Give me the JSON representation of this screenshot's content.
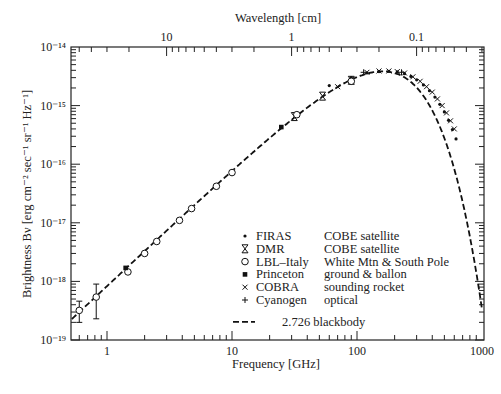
{
  "chart_data": {
    "type": "scatter",
    "title": "",
    "xlabel": "Frequency [GHz]",
    "x2label": "Wavelength [cm]",
    "ylabel": "Brightness Bν [erg cm⁻² sec⁻¹ sr⁻¹ Hz⁻¹]",
    "xscale": "log",
    "yscale": "log",
    "xlim": [
      0.5,
      1000
    ],
    "ylim": [
      1e-19,
      1e-14
    ],
    "x_ticks": [
      1,
      10,
      100,
      1000
    ],
    "x_tick_labels": [
      "1",
      "10",
      "100",
      "1000"
    ],
    "x2_ticks_cm": [
      10,
      1,
      0.1
    ],
    "x2_tick_labels": [
      "10",
      "1",
      "0.1"
    ],
    "y_ticks": [
      1e-14,
      1e-15,
      1e-16,
      1e-17,
      1e-18,
      1e-19
    ],
    "y_tick_labels": [
      "10⁻¹⁴",
      "10⁻¹⁵",
      "10⁻¹⁶",
      "10⁻¹⁷",
      "10⁻¹⁸",
      "10⁻¹⁹"
    ],
    "grid": false,
    "legend_position": "lower center-right inside plot",
    "series": [
      {
        "name": "FIRAS",
        "description": "COBE satellite",
        "marker": "dot",
        "x": [
          60,
          90,
          120,
          150,
          180,
          210,
          240,
          270,
          300,
          340,
          380,
          420,
          460,
          500,
          540,
          580,
          620
        ],
        "y": [
          2.2e-15,
          3e-15,
          3.6e-15,
          3.8e-15,
          3.85e-15,
          3.75e-15,
          3.5e-15,
          3.15e-15,
          2.75e-15,
          2.25e-15,
          1.8e-15,
          1.4e-15,
          1.05e-15,
          7.8e-16,
          5.6e-16,
          3.9e-16,
          2.7e-16
        ]
      },
      {
        "name": "DMR",
        "description": "COBE satellite",
        "marker": "hourglass",
        "x": [
          31.5,
          53,
          90
        ],
        "y": [
          6.5e-16,
          1.45e-15,
          2.7e-15
        ]
      },
      {
        "name": "LBL–Italy",
        "description": "White Mtn & South Pole",
        "marker": "circle",
        "x": [
          0.6,
          0.82,
          1.47,
          2.0,
          2.5,
          3.8,
          4.75,
          7.5,
          10,
          33,
          90
        ],
        "y": [
          3.2e-19,
          5.4e-19,
          1.45e-18,
          3e-18,
          4.8e-18,
          1.1e-17,
          1.75e-17,
          4.2e-17,
          7.2e-17,
          7e-16,
          2.6e-15
        ],
        "errors": [
          [
            2e-19,
            4.6e-19
          ],
          [
            2.3e-19,
            9e-19
          ]
        ]
      },
      {
        "name": "Princeton",
        "description": "ground & ballon",
        "marker": "filled-square",
        "x": [
          1.41,
          24.8
        ],
        "y": [
          1.7e-18,
          4.3e-16
        ]
      },
      {
        "name": "COBRA",
        "description": "sounding rocket",
        "marker": "x",
        "x": [
          70,
          120,
          150,
          180,
          210,
          240,
          280,
          320,
          360,
          400,
          440,
          480,
          520,
          560,
          600
        ],
        "y": [
          2.1e-15,
          3.7e-15,
          3.9e-15,
          3.9e-15,
          3.8e-15,
          3.6e-15,
          3.1e-15,
          2.6e-15,
          2.1e-15,
          1.7e-15,
          1.3e-15,
          1e-15,
          7.5e-16,
          5.5e-16,
          4e-16
        ]
      },
      {
        "name": "Cyanogen",
        "description": "optical",
        "marker": "plus",
        "x": [
          113,
          227
        ],
        "y": [
          3.7e-15,
          3.7e-15
        ]
      },
      {
        "name": "2.726 blackbody",
        "description": "",
        "marker": "dashed-line",
        "temperature_K": 2.726
      }
    ]
  },
  "legend": {
    "items": [
      {
        "symbol": "dot",
        "name": "FIRAS",
        "desc": "COBE satellite"
      },
      {
        "symbol": "hourglass",
        "name": "DMR",
        "desc": "COBE satellite"
      },
      {
        "symbol": "circle",
        "name": "LBL–Italy",
        "desc": "White Mtn & South Pole"
      },
      {
        "symbol": "filled-square",
        "name": "Princeton",
        "desc": "ground & ballon"
      },
      {
        "symbol": "x",
        "name": "COBRA",
        "desc": "sounding rocket"
      },
      {
        "symbol": "plus",
        "name": "Cyanogen",
        "desc": "optical"
      }
    ],
    "curve_label": "2.726 blackbody"
  },
  "style": {
    "ink": "#1a1a1a",
    "background": "#ffffff"
  }
}
